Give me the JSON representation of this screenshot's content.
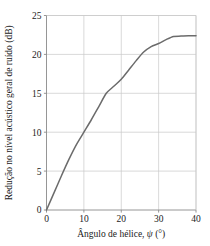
{
  "chart_data": {
    "type": "line",
    "title": "",
    "xlabel": "Ângulo de hélice, ψ (°)",
    "xlabel_text": "Ângulo de hélice,",
    "xlabel_symbol": "ψ",
    "xlabel_unit": "(°)",
    "ylabel": "Redução no nível acústico geral de ruído (dB)",
    "xlim": [
      0,
      40
    ],
    "ylim": [
      0,
      25
    ],
    "xticks": [
      0,
      10,
      20,
      30,
      40
    ],
    "yticks": [
      0,
      5,
      10,
      15,
      20,
      25
    ],
    "xtick_labels": [
      "0",
      "10",
      "20",
      "30",
      "40"
    ],
    "ytick_labels": [
      "0",
      "5",
      "10",
      "15",
      "20",
      "25"
    ],
    "grid": true,
    "legend": false,
    "series": [
      {
        "name": "Redução de ruído",
        "x": [
          0,
          2,
          4,
          6,
          8,
          10,
          12,
          14,
          16,
          18,
          20,
          22,
          24,
          26,
          28,
          30,
          32,
          34,
          36,
          38,
          40
        ],
        "values": [
          0.0,
          2.2,
          4.4,
          6.5,
          8.4,
          10.0,
          11.6,
          13.3,
          15.0,
          15.9,
          16.8,
          18.0,
          19.2,
          20.3,
          21.0,
          21.4,
          21.9,
          22.3,
          22.35,
          22.4,
          22.4
        ]
      }
    ],
    "colors": {
      "line": "#6b6b6b",
      "grid": "#c8c8c8",
      "axis": "#8a8a8a",
      "text": "#1a1a1a",
      "background": "#ffffff"
    }
  }
}
